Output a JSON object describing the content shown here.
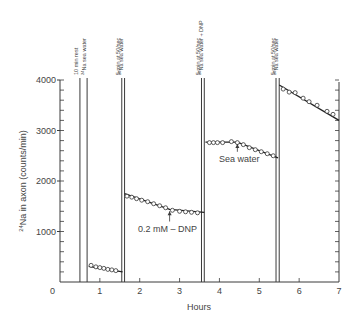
{
  "chart_data": {
    "type": "line",
    "title": "",
    "xlabel": "Hours",
    "ylabel": "24Na in axon (counts/min)",
    "ylabel_sup": "24",
    "ylabel_rest": "Na in axon (counts/min)",
    "xlim": [
      0,
      7
    ],
    "ylim": [
      0,
      4000
    ],
    "x_ticks": [
      0,
      1,
      2,
      3,
      4,
      5,
      6,
      7
    ],
    "x_tick_labels": [
      "0",
      "1",
      "2",
      "3",
      "4",
      "5",
      "6",
      "7"
    ],
    "y_ticks": [
      0,
      1000,
      2000,
      3000,
      4000
    ],
    "y_tick_labels": [
      "0",
      "1000",
      "2000",
      "3000",
      "4000"
    ],
    "y_minor_step": 200,
    "grid": false,
    "right_axis_ticks": true,
    "series": [
      {
        "name": "Segment 1 (after 24Na sea water)",
        "x": [
          0.78,
          0.9,
          1.0,
          1.1,
          1.2,
          1.3,
          1.4
        ],
        "values": [
          330,
          300,
          285,
          270,
          250,
          240,
          225
        ],
        "fit": [
          [
            0.72,
            310
          ],
          [
            1.57,
            200
          ]
        ]
      },
      {
        "name": "Segment 2 (after 5 min at 50/sec, 24Na sea water)",
        "x": [
          1.68,
          1.8,
          1.92,
          2.05,
          2.2,
          2.35,
          2.5,
          2.65,
          2.82,
          3.0,
          3.15,
          3.3,
          3.45
        ],
        "values": [
          1700,
          1680,
          1650,
          1620,
          1590,
          1550,
          1510,
          1470,
          1420,
          1400,
          1390,
          1380,
          1370
        ],
        "fit": [
          [
            1.62,
            1750
          ],
          [
            2.75,
            1440
          ],
          [
            3.62,
            1380
          ]
        ]
      },
      {
        "name": "Segment 3 (after 5 min at 50/sec, 24Na sea water + DNP)",
        "x": [
          3.75,
          3.85,
          3.95,
          4.08,
          4.3,
          4.45,
          4.6,
          4.75,
          4.9,
          5.05,
          5.2,
          5.35
        ],
        "values": [
          2760,
          2760,
          2760,
          2760,
          2780,
          2760,
          2720,
          2660,
          2620,
          2580,
          2540,
          2500
        ],
        "fit": [
          [
            3.65,
            2770
          ],
          [
            4.45,
            2770
          ],
          [
            5.47,
            2460
          ]
        ]
      },
      {
        "name": "Segment 4 (after 5 min at 50/sec, 24Na sea water)",
        "x": [
          5.6,
          5.75,
          5.9,
          6.1,
          6.25,
          6.45,
          6.7,
          6.85
        ],
        "values": [
          3820,
          3760,
          3750,
          3640,
          3570,
          3500,
          3380,
          3320
        ],
        "fit": [
          [
            5.5,
            3900
          ],
          [
            7.0,
            3200
          ]
        ]
      }
    ],
    "vertical_markers": [
      {
        "x": 0.5,
        "label": "10 min rest"
      },
      {
        "x": 0.68,
        "label": "24Na sea water",
        "sup": "24",
        "rest": "Na sea water"
      },
      {
        "x": 1.55,
        "label": "5 min at 50/sec"
      },
      {
        "x": 1.62,
        "label": "24Na sea water",
        "sup": "24",
        "rest": "Na sea water"
      },
      {
        "x": 3.55,
        "label": "5 min at 50/sec"
      },
      {
        "x": 3.62,
        "label": "24Na sea water + DNP",
        "sup": "24",
        "rest": "Na sea water + DNP"
      },
      {
        "x": 5.42,
        "label": "5 min at 50/sec"
      },
      {
        "x": 5.5,
        "label": "24Na sea water",
        "sup": "24",
        "rest": "Na sea water"
      }
    ],
    "annotations": [
      {
        "text": "0.2 mM – DNP",
        "arrow_to": [
          2.75,
          1440
        ],
        "text_pos": [
          2.7,
          1000
        ]
      },
      {
        "text": "Sea water",
        "arrow_to": [
          4.45,
          2770
        ],
        "text_pos": [
          4.5,
          2380
        ]
      }
    ]
  }
}
